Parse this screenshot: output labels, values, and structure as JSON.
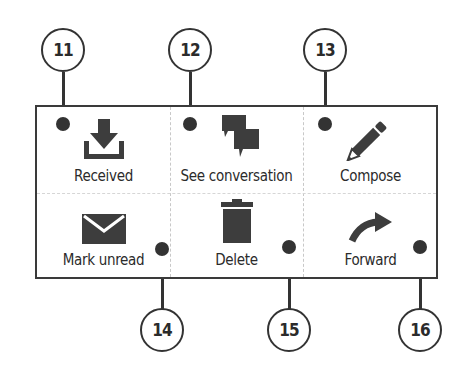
{
  "menu": {
    "items": [
      {
        "label": "Received",
        "icon": "download-tray-icon",
        "callout": "11"
      },
      {
        "label": "See conversation",
        "icon": "chat-bubbles-icon",
        "callout": "12"
      },
      {
        "label": "Compose",
        "icon": "pencil-icon",
        "callout": "13"
      },
      {
        "label": "Mark unread",
        "icon": "envelope-icon",
        "callout": "14"
      },
      {
        "label": "Delete",
        "icon": "trash-icon",
        "callout": "15"
      },
      {
        "label": "Forward",
        "icon": "forward-arrow-icon",
        "callout": "16"
      }
    ]
  },
  "colors": {
    "icon": "#3d3d3d",
    "border": "#3a3a3a",
    "divider": "#c8c8c8",
    "background": "#ffffff"
  }
}
